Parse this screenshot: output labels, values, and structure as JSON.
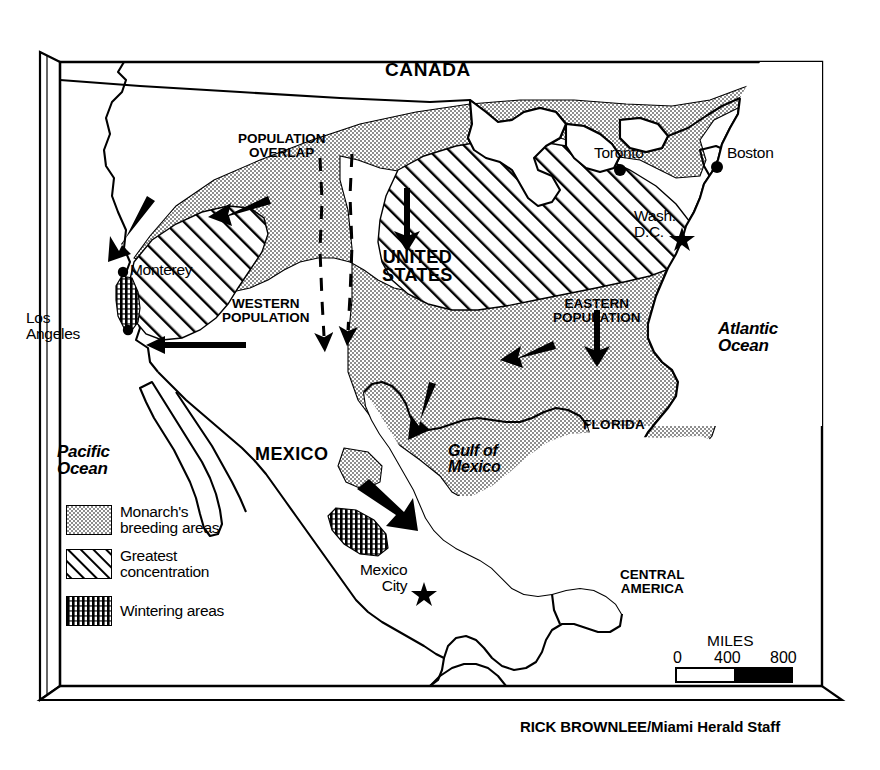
{
  "graphic": {
    "type": "map",
    "subject": "Monarch butterfly migration map of North America",
    "credit": "RICK BROWNLEE/Miami Herald Staff"
  },
  "countries": [
    {
      "name": "CANADA",
      "x": 385,
      "y": 60,
      "style": "country"
    },
    {
      "name": "UNITED\nSTATES",
      "x": 382,
      "y": 248,
      "style": "country-sm"
    },
    {
      "name": "MEXICO",
      "x": 255,
      "y": 445,
      "style": "country-sm"
    },
    {
      "name": "CENTRAL\nAMERICA",
      "x": 620,
      "y": 568,
      "style": "region"
    }
  ],
  "regions": [
    {
      "name": "POPULATION\nOVERLAP",
      "x": 238,
      "y": 132
    },
    {
      "name": "WESTERN\nPOPULATION",
      "x": 222,
      "y": 297
    },
    {
      "name": "EASTERN\nPOPULATION",
      "x": 553,
      "y": 297
    }
  ],
  "states": [
    {
      "name": "FLORIDA",
      "x": 583,
      "y": 418
    }
  ],
  "oceans": [
    {
      "name": "Atlantic\nOcean",
      "x": 718,
      "y": 320,
      "style": "ocean"
    },
    {
      "name": "Pacific\nOcean",
      "x": 57,
      "y": 443,
      "style": "ocean"
    },
    {
      "name": "Gulf of\nMexico",
      "x": 448,
      "y": 443,
      "style": "ocean-sm"
    }
  ],
  "cities": [
    {
      "name": "Monterey",
      "x": 77,
      "y": 262,
      "dot_x": 123,
      "dot_y": 272,
      "marker": "dot"
    },
    {
      "name": "Los\nAngeles",
      "x": 26,
      "y": 310,
      "dot_x": 128,
      "dot_y": 330,
      "marker": "dot"
    },
    {
      "name": "Toronto",
      "x": 594,
      "y": 145,
      "dot_x": 620,
      "dot_y": 170,
      "marker": "dot"
    },
    {
      "name": "Boston",
      "x": 727,
      "y": 145,
      "dot_x": 717,
      "dot_y": 167,
      "marker": "dot"
    },
    {
      "name": "Wash.\nD.C.",
      "x": 634,
      "y": 208,
      "dot_x": 682,
      "dot_y": 237,
      "marker": "star"
    },
    {
      "name": "Mexico\nCity",
      "x": 360,
      "y": 562,
      "dot_x": 424,
      "dot_y": 592,
      "marker": "star"
    }
  ],
  "legend": {
    "title": "",
    "items": [
      {
        "label": "Monarch's\nbreeding areas",
        "pattern": "stipple"
      },
      {
        "label": "Greatest\nconcentration",
        "pattern": "diagonal-hatch"
      },
      {
        "label": "Wintering areas",
        "pattern": "vertical-hatch"
      }
    ]
  },
  "scale": {
    "units_label": "MILES",
    "ticks": [
      "0",
      "400",
      "800"
    ],
    "max_value": 800
  },
  "colors": {
    "ink": "#000000",
    "paper": "#ffffff",
    "stipple_fill": "#a6a6a6"
  }
}
